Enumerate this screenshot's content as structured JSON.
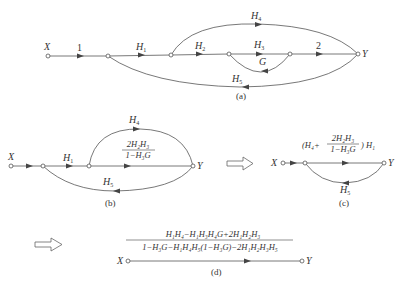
{
  "diagram_a": {
    "caption": "(a)",
    "nodes": [
      "X",
      "",
      "",
      "",
      "",
      "Y"
    ],
    "edges": {
      "x_to_n1": "1",
      "n1_to_n2": "H1",
      "n2_to_n3": "H2",
      "n3_to_n4": "H3",
      "n4_to_n3": "G",
      "n4_to_y": "2",
      "n2_to_y": "H4",
      "y_to_n1": "H5"
    },
    "labels": {
      "X": "X",
      "Y": "Y",
      "one": "1",
      "two": "2",
      "H1": "H",
      "H1sub": "1",
      "H2": "H",
      "H2sub": "2",
      "H3": "H",
      "H3sub": "3",
      "G": "G",
      "H4": "H",
      "H4sub": "4",
      "H5": "H",
      "H5sub": "5"
    }
  },
  "diagram_b": {
    "caption": "(b)",
    "labels": {
      "X": "X",
      "Y": "Y",
      "H1": "H",
      "H1sub": "1",
      "H4": "H",
      "H4sub": "4",
      "H5": "H",
      "H5sub": "5"
    },
    "fraction": {
      "numerator": "2H₂H₃",
      "denominator": "1−H₃G"
    }
  },
  "diagram_c": {
    "caption": "(c)",
    "labels": {
      "X": "X",
      "Y": "Y",
      "H5": "H",
      "H5sub": "5"
    },
    "forward_gain": {
      "open": "(H₄+",
      "numerator": "2H₂H₃",
      "denominator": "1−H₃G",
      "close": ") H₁"
    }
  },
  "diagram_d": {
    "caption": "(d)",
    "labels": {
      "X": "X",
      "Y": "Y"
    },
    "fraction": {
      "numerator": "H₁H₄−H₁H₃H₄G+2H₁H₂H₃",
      "denominator": "1−H₃G−H₁H₄H₅(1−H₃G)−2H₁H₂H₃H₅"
    }
  },
  "transform_arrows": [
    "b-to-c",
    "c-to-d"
  ]
}
